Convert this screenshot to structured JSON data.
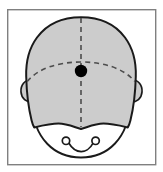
{
  "figure": {
    "title": "Frontal view of head with vertex landmark",
    "caption": "",
    "frame": {
      "visible": true,
      "x": 7,
      "y": 9,
      "width": 149,
      "height": 156,
      "stroke_color": "#808080",
      "stroke_width": 1.4,
      "fill_color": "#ffffff"
    },
    "colors": {
      "background": "#ffffff",
      "cranium_fill": "#cccccc",
      "face_fill": "#ffffff",
      "outline": "#1a1a1a",
      "dashed_axis": "#4d4d4d",
      "landmark_dot": "#000000",
      "frame_border": "#808080"
    },
    "parts": [
      {
        "name": "cranium",
        "label": "Cranium / skull vault (shaded)",
        "fill": "#cccccc",
        "stroke": "#1a1a1a",
        "stroke_width": 2.0
      },
      {
        "name": "face",
        "label": "Lower face / mandible region (unshaded)",
        "fill": "#ffffff",
        "stroke": "#1a1a1a",
        "stroke_width": 1.8
      },
      {
        "name": "ear-left",
        "label": "Left ear (viewer left)",
        "fill": "#cccccc",
        "stroke": "#1a1a1a",
        "stroke_width": 1.6,
        "center_x": 27,
        "center_y": 90
      },
      {
        "name": "ear-right",
        "label": "Right ear (viewer right)",
        "fill": "#cccccc",
        "stroke": "#1a1a1a",
        "stroke_width": 1.6,
        "center_x": 136,
        "center_y": 90
      },
      {
        "name": "nostril-left",
        "label": "Left nostril marker",
        "fill": "#ffffff",
        "stroke": "#1a1a1a",
        "stroke_width": 1.6,
        "center_x": 66,
        "center_y": 141,
        "radius": 3.6
      },
      {
        "name": "nostril-right",
        "label": "Right nostril marker",
        "fill": "#ffffff",
        "stroke": "#1a1a1a",
        "stroke_width": 1.6,
        "center_x": 95,
        "center_y": 141,
        "radius": 3.6
      }
    ],
    "axes": [
      {
        "name": "midsagittal-axis",
        "label": "Vertical midline (midsagittal)",
        "orientation": "vertical",
        "style": "dashed",
        "dash_pattern": "5 4",
        "stroke": "#4d4d4d",
        "stroke_width": 1.6,
        "x": 81,
        "y_start": 18,
        "y_end": 127
      },
      {
        "name": "coronal-axis",
        "label": "Horizontal reference arc (coronal)",
        "orientation": "horizontal-arc",
        "style": "dashed",
        "dash_pattern": "5 4",
        "stroke": "#4d4d4d",
        "stroke_width": 1.6,
        "y": 71,
        "x_start": 28,
        "x_end": 135
      }
    ],
    "landmark": {
      "name": "vertex-landmark",
      "label": "Central landmark point",
      "x": 81,
      "y": 71,
      "radius": 6.2,
      "color": "#000000",
      "shape": "filled-circle"
    },
    "geometry": {
      "head_center_x": 81,
      "head_top_y": 17,
      "head_left_x": 26,
      "head_right_x": 137,
      "chin_bottom_y": 153,
      "jawline_y": 127
    }
  }
}
